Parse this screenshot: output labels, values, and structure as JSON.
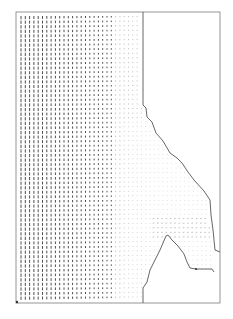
{
  "figure": {
    "type": "vector-field-plot",
    "frame": {
      "x0": 16,
      "y0": 12,
      "x1": 220,
      "y1": 303
    },
    "colors": {
      "background": "#ffffff",
      "frame": "#8a8a8a",
      "boundary": "#555555",
      "vectors_dense": "#3a3a3a",
      "vectors_sparse": "#9a9a9a"
    },
    "grid": {
      "dx": 4.3,
      "dy": 4.6,
      "x_start": 21,
      "y_start": 16
    },
    "outer_boundary": [
      [
        143,
        12
      ],
      [
        143,
        105
      ],
      [
        146,
        108
      ],
      [
        147,
        117
      ],
      [
        152,
        122
      ],
      [
        156,
        133
      ],
      [
        163,
        141
      ],
      [
        170,
        153
      ],
      [
        177,
        158
      ],
      [
        182,
        163
      ],
      [
        188,
        172
      ],
      [
        194,
        180
      ],
      [
        204,
        191
      ],
      [
        210,
        200
      ],
      [
        211,
        215
      ],
      [
        213,
        230
      ],
      [
        215,
        250
      ],
      [
        220,
        252
      ]
    ],
    "obstacle_boundary": [
      [
        143,
        303
      ],
      [
        143,
        288
      ],
      [
        147,
        282
      ],
      [
        150,
        270
      ],
      [
        156,
        258
      ],
      [
        160,
        250
      ],
      [
        166,
        236
      ],
      [
        168,
        235
      ],
      [
        172,
        240
      ],
      [
        178,
        246
      ],
      [
        184,
        254
      ],
      [
        187,
        262
      ],
      [
        190,
        268
      ],
      [
        196,
        269
      ],
      [
        212,
        269
      ],
      [
        214,
        272
      ]
    ]
  },
  "caption": {
    "text": ""
  }
}
